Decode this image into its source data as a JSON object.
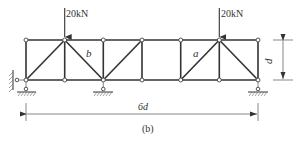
{
  "figure": {
    "caption": "(b)",
    "loads": [
      {
        "label": "20kN",
        "node": 1
      },
      {
        "label": "20kN",
        "node": 5
      }
    ],
    "member_labels": {
      "a": "a",
      "b": "b"
    },
    "dimensions": {
      "height": "d",
      "span": "6d"
    },
    "truss": {
      "panels": 6,
      "top_nodes_x": [
        26,
        64.7,
        103.3,
        142,
        180.7,
        219.3,
        258
      ],
      "top_y": 40,
      "bottom_y": 80,
      "diagonals": [
        {
          "panel": 1,
          "from": "bottom-left",
          "to": "top-right"
        },
        {
          "panel": 2,
          "from": "top-left",
          "to": "bottom-right",
          "label": "b"
        },
        {
          "panel": 3,
          "from": "bottom-left",
          "to": "top-right"
        },
        {
          "panel": 4,
          "from": null,
          "to": null
        },
        {
          "panel": 5,
          "from": "bottom-left",
          "to": "top-right",
          "label": "a"
        },
        {
          "panel": 6,
          "from": "top-left",
          "to": "bottom-right"
        }
      ],
      "supports": [
        {
          "type": "pin",
          "node": 0
        },
        {
          "type": "roller",
          "node": 2
        },
        {
          "type": "roller",
          "node": 6
        }
      ]
    },
    "colors": {
      "line": "#333333",
      "background": "#ffffff"
    }
  }
}
